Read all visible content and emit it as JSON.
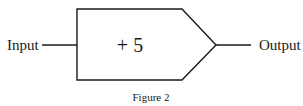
{
  "diagram": {
    "input_label": "Input",
    "operation_label": "+ 5",
    "output_label": "Output",
    "caption": "Figure 2",
    "stroke_color": "#1a1a1a",
    "background_color": "#ffffff"
  }
}
